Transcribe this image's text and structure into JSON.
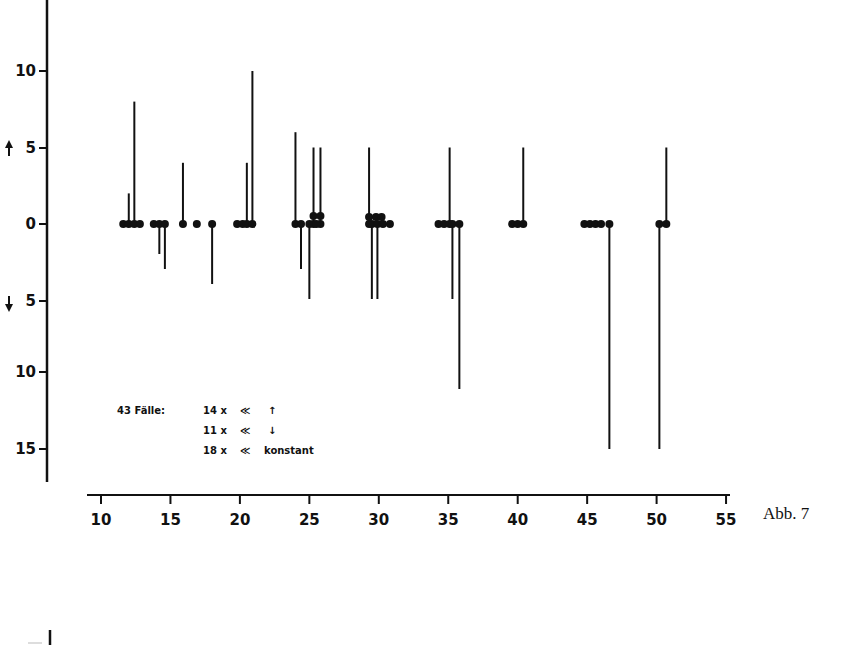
{
  "caption": "Abb. 7",
  "chart_data": {
    "type": "scatter",
    "title": "",
    "caption": "Abb. 7",
    "xlabel": "",
    "ylabel": "",
    "x_ticks": [
      10,
      15,
      20,
      25,
      30,
      35,
      40,
      45,
      50,
      55
    ],
    "xlim": [
      10,
      55
    ],
    "y_ticks_up": [
      10,
      5,
      0
    ],
    "y_ticks_down": [
      5,
      10,
      15
    ],
    "y_tick_labels": [
      "10",
      "5",
      "0",
      "5",
      "10",
      "15"
    ],
    "y_direction_markers": {
      "up": "↑",
      "down": "↓"
    },
    "grid": false,
    "note": "Dots at baseline 0 with vertical lines; upward line = increase, downward line = decrease",
    "points": [
      {
        "x": 11.6,
        "v": 0
      },
      {
        "x": 12.0,
        "v": 2
      },
      {
        "x": 12.4,
        "v": 8
      },
      {
        "x": 12.8,
        "v": 0
      },
      {
        "x": 13.8,
        "v": 0
      },
      {
        "x": 14.2,
        "v": -2
      },
      {
        "x": 14.6,
        "v": -3
      },
      {
        "x": 15.9,
        "v": 4
      },
      {
        "x": 16.9,
        "v": 0
      },
      {
        "x": 18.0,
        "v": -4
      },
      {
        "x": 19.8,
        "v": 0
      },
      {
        "x": 20.2,
        "v": 0
      },
      {
        "x": 20.5,
        "v": 4
      },
      {
        "x": 20.9,
        "v": 10
      },
      {
        "x": 24.0,
        "v": 6
      },
      {
        "x": 24.4,
        "v": -3
      },
      {
        "x": 25.0,
        "v": -5
      },
      {
        "x": 25.3,
        "v": 5
      },
      {
        "x": 25.8,
        "v": 5
      },
      {
        "x": 25.5,
        "v": 0
      },
      {
        "x": 29.3,
        "v": 5
      },
      {
        "x": 29.5,
        "v": -5
      },
      {
        "x": 29.9,
        "v": -5
      },
      {
        "x": 30.3,
        "v": 0
      },
      {
        "x": 30.8,
        "v": 0
      },
      {
        "x": 34.3,
        "v": 0
      },
      {
        "x": 34.7,
        "v": 0
      },
      {
        "x": 35.1,
        "v": 5
      },
      {
        "x": 35.3,
        "v": -5
      },
      {
        "x": 35.8,
        "v": -11
      },
      {
        "x": 39.6,
        "v": 0
      },
      {
        "x": 40.0,
        "v": 0
      },
      {
        "x": 40.4,
        "v": 5
      },
      {
        "x": 44.8,
        "v": 0
      },
      {
        "x": 45.2,
        "v": 0
      },
      {
        "x": 45.6,
        "v": 0
      },
      {
        "x": 46.0,
        "v": 0
      },
      {
        "x": 46.6,
        "v": -15
      },
      {
        "x": 50.2,
        "v": -15
      },
      {
        "x": 50.7,
        "v": 5
      }
    ],
    "legend": {
      "title": "43 Fälle:",
      "rows": [
        {
          "count": "14 x",
          "symbol": "≪",
          "meaning": "↑"
        },
        {
          "count": "11 x",
          "symbol": "≪",
          "meaning": "↓"
        },
        {
          "count": "18 x",
          "symbol": "≪",
          "meaning": "konstant"
        }
      ]
    }
  }
}
